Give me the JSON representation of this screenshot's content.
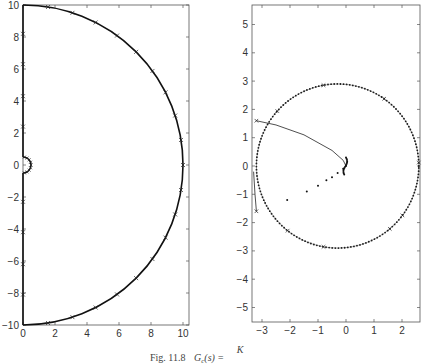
{
  "caption": {
    "prefix": "Fig. 11.8",
    "text": "G",
    "sub": "c",
    "rest": "(s) =",
    "frac_num": "K"
  },
  "chart_data": [
    {
      "type": "line",
      "title": "",
      "xlabel": "",
      "ylabel": "",
      "xlim": [
        0,
        10.4
      ],
      "ylim": [
        -10,
        10
      ],
      "xticks": [
        "0",
        "2",
        "4",
        "6",
        "8",
        "10"
      ],
      "yticks": [
        "-10",
        "-8",
        "-6",
        "-4",
        "-2",
        "0",
        "2",
        "4",
        "6",
        "8",
        "10"
      ],
      "grid": false,
      "description": "Nyquist-style contour: vertical line along imaginary axis from -10 to 10 with small semicircular indentation of radius ~0.5 around origin, closed by large semicircle of radius 10 in right half-plane; x markers along path",
      "series": [
        {
          "name": "imag-axis-segment-upper",
          "x": [
            0,
            0
          ],
          "y": [
            0.5,
            10
          ]
        },
        {
          "name": "indentation",
          "center": [
            0,
            0
          ],
          "radius": 0.5,
          "angle_range_deg": [
            -90,
            90
          ]
        },
        {
          "name": "imag-axis-segment-lower",
          "x": [
            0,
            0
          ],
          "y": [
            -10,
            -0.5
          ]
        },
        {
          "name": "large-semicircle",
          "center": [
            0,
            0
          ],
          "radius": 10,
          "angle_range_deg": [
            -90,
            90
          ]
        }
      ],
      "markers_y_on_axis": [
        8.2,
        6.3,
        4.3,
        2.4,
        -2.3,
        -4.2,
        -6.2,
        -8.1
      ],
      "markers_on_arc_deg": [
        81,
        72,
        63,
        54,
        45,
        36,
        27,
        18,
        9,
        0,
        -9,
        -18,
        -27,
        -36,
        -45,
        -54,
        -63,
        -72,
        -81
      ]
    },
    {
      "type": "scatter",
      "title": "",
      "xlabel": "",
      "ylabel": "",
      "xlim": [
        -3.35,
        2.65
      ],
      "ylim": [
        -5.6,
        5.7
      ],
      "xticks": [
        "-3",
        "-2",
        "-1",
        "0",
        "1",
        "2"
      ],
      "yticks": [
        "-5",
        "-4",
        "-3",
        "-2",
        "-1",
        "0",
        "1",
        "2",
        "3",
        "4",
        "5"
      ],
      "grid": false,
      "description": "Mapped contour: dotted circle centered near (-0.3, 0) radius ~2.9; solid curve from (-3.2, 1.6) to origin region, and dots from origin toward (-2.1, -1.2); short segment from (-3.2,-1.6) upward",
      "series": [
        {
          "name": "circle",
          "center": [
            -0.3,
            0
          ],
          "radius": 2.9
        },
        {
          "name": "upper-branch",
          "x": [
            -3.2,
            -2.5,
            -1.5,
            -0.5,
            -0.1,
            0
          ],
          "y": [
            1.6,
            1.45,
            1.1,
            0.55,
            0.2,
            0
          ]
        },
        {
          "name": "lower-dots",
          "x": [
            0,
            -0.1,
            -0.3,
            -0.5,
            -0.7,
            -1.0,
            -1.4,
            -2.1
          ],
          "y": [
            0,
            -0.1,
            -0.25,
            -0.4,
            -0.5,
            -0.7,
            -0.9,
            -1.2
          ]
        },
        {
          "name": "left-segment",
          "x": [
            -3.2,
            -3.25,
            -3.3
          ],
          "y": [
            -1.6,
            -1.0,
            -0.2
          ]
        }
      ]
    }
  ]
}
